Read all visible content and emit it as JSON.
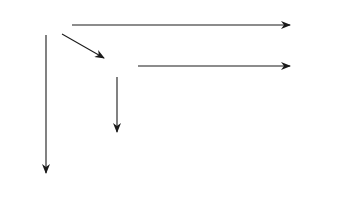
{
  "diagram": {
    "type": "commutative-diagram",
    "nodes": {
      "SkCprime": {
        "base": "S",
        "sup": "k",
        "tail": "C′"
      },
      "SkC": {
        "base": "S",
        "sup": "k",
        "tail": "C"
      },
      "Sk1A_top": {
        "base": "S",
        "sup": "k+1",
        "tail": "A"
      },
      "Sk1A_mid": {
        "base": "S",
        "sup": "k+1",
        "tail": "A"
      },
      "TkC": {
        "base": "T",
        "sup": "k",
        "tail": "C"
      },
      "TkCprime": {
        "base": "T",
        "sup": "k",
        "tail": "C′"
      },
      "Tk1A_mid": {
        "base": "T",
        "sup": "k+1",
        "tail": "A"
      },
      "Tk1A_bot": {
        "base": "T",
        "sup": "k+1",
        "tail": "A"
      }
    },
    "labels": {
      "delta_top": {
        "base": "δ",
        "sup": "k"
      },
      "delta_mid": {
        "base": "δ",
        "sup": "k"
      },
      "phi_Cprime": {
        "base": "φ",
        "sup": "k",
        "tail": "(C′)"
      },
      "phi_C": {
        "base": "φ",
        "sup": "k",
        "tail": "(C)"
      },
      "phi_A": {
        "base": "φ",
        "sup": "k+1",
        "tail": "(A)"
      },
      "eps_mid": {
        "base": "ε",
        "sup": "k"
      },
      "eps_bot": {
        "base": "ε",
        "sup": "k"
      }
    },
    "edges": [
      {
        "from": "SkCprime",
        "to": "Sk1A_top",
        "label": "δ^k",
        "style": "arrow"
      },
      {
        "from": "SkCprime",
        "to": "SkC",
        "label": "",
        "style": "arrow"
      },
      {
        "from": "SkC",
        "to": "Sk1A_mid",
        "label": "δ^k",
        "style": "arrow"
      },
      {
        "from": "Sk1A_top",
        "to": "Sk1A_mid",
        "label": "",
        "style": "equality"
      },
      {
        "from": "SkCprime",
        "to": "TkCprime",
        "label": "φ^k(C′)",
        "style": "arrow"
      },
      {
        "from": "SkC",
        "to": "TkC",
        "label": "φ^k(C)",
        "style": "arrow"
      },
      {
        "from": "Sk1A_mid",
        "to": "Tk1A_mid",
        "label": "φ^{k+1}(A)",
        "style": "arrow"
      },
      {
        "from": "TkCprime",
        "to": "TkC",
        "label": "",
        "style": "arrow"
      },
      {
        "from": "TkC",
        "to": "Tk1A_mid",
        "label": "ε^k",
        "style": "arrow"
      },
      {
        "from": "Tk1A_mid",
        "to": "Tk1A_bot",
        "label": "",
        "style": "equality"
      },
      {
        "from": "TkCprime",
        "to": "Tk1A_bot",
        "label": "ε^k",
        "style": "arrow"
      }
    ],
    "dots": 4
  }
}
